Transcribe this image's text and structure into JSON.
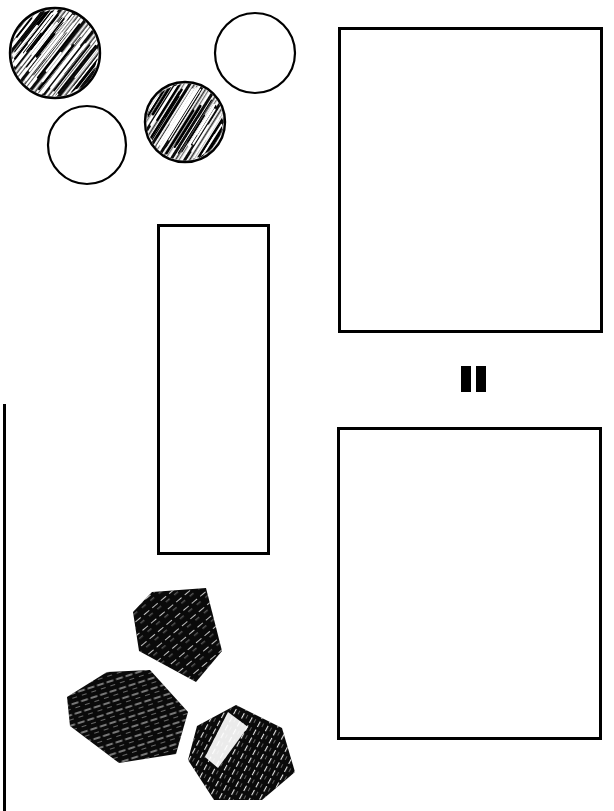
{
  "figure": {
    "background_color": "#ffffff",
    "ink_color": "#000000",
    "width": 614,
    "height": 811,
    "style": "black-and-white line-art scan"
  },
  "left_margin_rule": {
    "name": "vertical-rule",
    "x": 3,
    "y_start": 404,
    "y_end": 811,
    "thickness": 3,
    "color": "#000000"
  },
  "circles": [
    {
      "label": "hatched-circle-1",
      "fill_style": "hatched",
      "cx": 55,
      "cy": 53,
      "r": 45,
      "stroke_width": 2.4,
      "hatch_angle": -52
    },
    {
      "label": "plain-circle-1",
      "fill_style": "outline",
      "cx": 255,
      "cy": 53,
      "r": 40,
      "stroke_width": 2.2,
      "hatch_angle": 0
    },
    {
      "label": "hatched-circle-2",
      "fill_style": "hatched",
      "cx": 185,
      "cy": 122,
      "r": 40,
      "stroke_width": 2.4,
      "hatch_angle": -58
    },
    {
      "label": "plain-circle-2",
      "fill_style": "outline",
      "cx": 87,
      "cy": 145,
      "r": 39,
      "stroke_width": 2.2,
      "hatch_angle": 0
    }
  ],
  "rectangles": [
    {
      "label": "tall-rectangle",
      "x": 157,
      "y": 224,
      "width": 113,
      "height": 331,
      "stroke_width": 3,
      "fill": "#ffffff"
    },
    {
      "label": "upper-square",
      "x": 338,
      "y": 27,
      "width": 265,
      "height": 306,
      "stroke_width": 3,
      "fill": "#ffffff"
    },
    {
      "label": "lower-square",
      "x": 337,
      "y": 427,
      "width": 265,
      "height": 313,
      "stroke_width": 3,
      "fill": "#ffffff"
    }
  ],
  "equals_glyph": {
    "label": "double-bar-glyph",
    "symbol": "II",
    "bars": [
      {
        "x": 461,
        "y": 366,
        "width": 10,
        "height": 26
      },
      {
        "x": 476,
        "y": 366,
        "width": 10,
        "height": 26
      }
    ],
    "color": "#000000"
  },
  "black_solids": [
    {
      "label": "black-chunk-top",
      "points": "152,592 206,588 222,651 196,682 139,651 133,612",
      "fill": "#0a0a0a",
      "highlight_angle": -40
    },
    {
      "label": "black-chunk-left",
      "points": "107,672 150,670 188,712 176,754 119,763 70,726 67,697",
      "fill": "#0a0a0a",
      "highlight_angle": -20
    },
    {
      "label": "black-chunk-bottom-right",
      "points": "236,705 282,728 295,772 262,800 214,800 188,760 197,726",
      "fill": "#0a0a0a",
      "highlight_angle": -62
    }
  ],
  "a11y": {
    "figure_description": "Black and white line drawing: four circles (two hatched, two plain outlines) at upper left, a tall vertical rectangle at center, two large empty squares at right separated by a double-bar equals-like mark, three solid black angular chunks at lower left, and a vertical rule along the left margin."
  }
}
